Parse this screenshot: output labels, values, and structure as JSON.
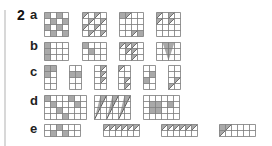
{
  "exercise": {
    "number": "2",
    "parts": [
      {
        "label": "a",
        "top": 7
      },
      {
        "label": "b",
        "top": 38
      },
      {
        "label": "c",
        "top": 64
      },
      {
        "label": "d",
        "top": 93
      },
      {
        "label": "e",
        "top": 121
      }
    ]
  },
  "colors": {
    "grid_line": "#7a7a7a",
    "shade": "#a9a9a9",
    "rule": "#d8d8d8"
  },
  "grids": [
    {
      "part": "a",
      "x": 44,
      "y": 12,
      "cols": 4,
      "rows": 4,
      "cell": 6,
      "shaded": [
        [
          0,
          0
        ],
        [
          0,
          2
        ],
        [
          1,
          1
        ],
        [
          1,
          3
        ],
        [
          2,
          0
        ],
        [
          2,
          2
        ],
        [
          3,
          1
        ],
        [
          3,
          3
        ]
      ],
      "diag": []
    },
    {
      "part": "a",
      "x": 82,
      "y": 12,
      "cols": 4,
      "rows": 4,
      "cell": 6,
      "shaded": [],
      "diag": [
        [
          0,
          0
        ],
        [
          0,
          2
        ],
        [
          1,
          1
        ],
        [
          1,
          3
        ],
        [
          2,
          0
        ],
        [
          2,
          2
        ],
        [
          3,
          1
        ],
        [
          3,
          3
        ]
      ]
    },
    {
      "part": "a",
      "x": 119,
      "y": 12,
      "cols": 4,
      "rows": 4,
      "cell": 6,
      "shaded": [
        [
          0,
          0
        ],
        [
          3,
          3
        ]
      ],
      "diag": [
        [
          0,
          1
        ],
        [
          3,
          2
        ]
      ]
    },
    {
      "part": "a",
      "x": 156,
      "y": 12,
      "cols": 4,
      "rows": 4,
      "cell": 6,
      "shaded": [],
      "diag": [
        [
          0,
          0
        ],
        [
          0,
          2
        ],
        [
          1,
          0
        ],
        [
          1,
          2
        ]
      ]
    },
    {
      "part": "b",
      "x": 44,
      "y": 42,
      "cols": 4,
      "rows": 3,
      "cell": 6,
      "shaded": [
        [
          0,
          0
        ],
        [
          1,
          0
        ],
        [
          2,
          0
        ]
      ],
      "diag": []
    },
    {
      "part": "b",
      "x": 82,
      "y": 42,
      "cols": 4,
      "rows": 3,
      "cell": 6,
      "shaded": [
        [
          0,
          0
        ],
        [
          1,
          1
        ]
      ],
      "diag": []
    },
    {
      "part": "b",
      "x": 119,
      "y": 42,
      "cols": 4,
      "rows": 3,
      "cell": 6,
      "shaded": [],
      "diag": [
        [
          0,
          0
        ],
        [
          0,
          1
        ],
        [
          0,
          2
        ],
        [
          1,
          1
        ],
        [
          1,
          2
        ],
        [
          2,
          2
        ]
      ]
    },
    {
      "part": "b",
      "x": 156,
      "y": 42,
      "cols": 4,
      "rows": 3,
      "cell": 6,
      "shaded": [],
      "tri": true,
      "diag": []
    },
    {
      "part": "c",
      "x": 44,
      "y": 65,
      "cols": 2,
      "rows": 4,
      "cell": 6,
      "shaded": [
        [
          0,
          0
        ],
        [
          0,
          1
        ],
        [
          1,
          0
        ]
      ],
      "diag": []
    },
    {
      "part": "c",
      "x": 69,
      "y": 65,
      "cols": 2,
      "rows": 4,
      "cell": 6,
      "shaded": [
        [
          1,
          0
        ],
        [
          1,
          1
        ]
      ],
      "diag": []
    },
    {
      "part": "c",
      "x": 94,
      "y": 65,
      "cols": 2,
      "rows": 4,
      "cell": 6,
      "shaded": [],
      "diag": [
        [
          0,
          1
        ],
        [
          1,
          1
        ],
        [
          2,
          1
        ]
      ]
    },
    {
      "part": "c",
      "x": 118,
      "y": 65,
      "cols": 2,
      "rows": 4,
      "cell": 6,
      "shaded": [],
      "diag": [
        [
          0,
          0
        ],
        [
          2,
          1
        ],
        [
          3,
          1
        ]
      ]
    },
    {
      "part": "c",
      "x": 143,
      "y": 65,
      "cols": 2,
      "rows": 4,
      "cell": 6,
      "shaded": [
        [
          1,
          1
        ],
        [
          2,
          0
        ]
      ],
      "diag": []
    },
    {
      "part": "c",
      "x": 168,
      "y": 65,
      "cols": 2,
      "rows": 4,
      "cell": 6,
      "shaded": [],
      "diag": [
        [
          2,
          1
        ],
        [
          3,
          0
        ]
      ]
    },
    {
      "part": "d",
      "x": 44,
      "y": 95,
      "cols": 7,
      "rows": 4,
      "cell": 6,
      "shaded": [
        [
          0,
          0
        ],
        [
          0,
          4
        ],
        [
          1,
          1
        ],
        [
          1,
          5
        ],
        [
          2,
          2
        ],
        [
          3,
          3
        ]
      ],
      "diag": []
    },
    {
      "part": "d",
      "x": 94,
      "y": 95,
      "cols": 6,
      "rows": 4,
      "cell": 6,
      "shaded": [],
      "slants": [
        0,
        2,
        4
      ],
      "diag": []
    },
    {
      "part": "d",
      "x": 143,
      "y": 95,
      "cols": 6,
      "rows": 4,
      "cell": 6,
      "shaded": [
        [
          1,
          1
        ],
        [
          1,
          2
        ],
        [
          2,
          1
        ],
        [
          2,
          2
        ],
        [
          1,
          4
        ]
      ],
      "diag": []
    },
    {
      "part": "e",
      "x": 44,
      "y": 124,
      "cols": 6,
      "rows": 2,
      "cell": 6,
      "shaded": [
        [
          0,
          2
        ],
        [
          1,
          1
        ],
        [
          1,
          3
        ]
      ],
      "diag": []
    },
    {
      "part": "e",
      "x": 103,
      "y": 124,
      "cols": 6,
      "rows": 2,
      "cell": 6,
      "shaded": [],
      "diag": [
        [
          0,
          0
        ],
        [
          0,
          1
        ],
        [
          0,
          2
        ],
        [
          0,
          3
        ],
        [
          0,
          4
        ],
        [
          0,
          5
        ]
      ]
    },
    {
      "part": "e",
      "x": 161,
      "y": 124,
      "cols": 6,
      "rows": 2,
      "cell": 6,
      "shaded": [],
      "diag": [
        [
          0,
          0
        ],
        [
          0,
          1
        ],
        [
          0,
          2
        ],
        [
          0,
          3
        ],
        [
          0,
          4
        ],
        [
          0,
          5
        ]
      ]
    },
    {
      "part": "e",
      "x": 219,
      "y": 124,
      "cols": 6,
      "rows": 2,
      "cell": 6,
      "shaded": [
        [
          0,
          0
        ]
      ],
      "diag": [
        [
          1,
          0
        ],
        [
          0,
          1
        ]
      ]
    }
  ]
}
